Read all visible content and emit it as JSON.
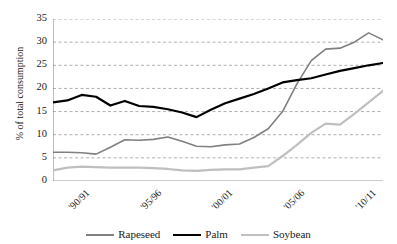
{
  "chart_data": {
    "type": "line",
    "title": "",
    "xlabel": "",
    "ylabel": "% of total consumption",
    "ylim": [
      0,
      35
    ],
    "ytick_labels": [
      "0",
      "5",
      "10",
      "15",
      "20",
      "25",
      "30",
      "35"
    ],
    "ytick_values": [
      0,
      5,
      10,
      15,
      20,
      25,
      30,
      35
    ],
    "grid": true,
    "grid_style": "dashed-horizontal",
    "legend_position": "bottom-center",
    "x": [
      "'90/91",
      "'91/92",
      "'92/93",
      "'93/94",
      "'94/95",
      "'95/96",
      "'96/97",
      "'97/98",
      "'98/99",
      "'99/00",
      "'00/01",
      "'01/02",
      "'02/03",
      "'03/04",
      "'04/05",
      "'05/06",
      "'06/07",
      "'07/08",
      "'08/09",
      "'09/10",
      "'10/11",
      "'11/12",
      "'12/13",
      "'13/14"
    ],
    "xtick_labels": [
      "'90/91",
      "'95/96",
      "'00/01",
      "'05/06",
      "'10/11"
    ],
    "xtick_indices": [
      0,
      5,
      10,
      15,
      20
    ],
    "series": [
      {
        "name": "Rapeseed",
        "color": "#808080",
        "values": [
          6.2,
          6.2,
          6.1,
          5.8,
          7.3,
          8.9,
          8.8,
          9.0,
          9.5,
          8.6,
          7.5,
          7.4,
          7.8,
          8.0,
          9.4,
          11.3,
          15.0,
          21.0,
          26.0,
          28.5,
          28.7,
          30.0,
          32.0,
          30.5
        ]
      },
      {
        "name": "Palm",
        "color": "#000000",
        "values": [
          17.0,
          17.4,
          18.6,
          18.2,
          16.3,
          17.3,
          16.2,
          16.0,
          15.5,
          14.8,
          13.8,
          15.4,
          16.8,
          17.8,
          18.8,
          20.0,
          21.3,
          21.8,
          22.2,
          23.0,
          23.8,
          24.4,
          25.0,
          25.5
        ]
      },
      {
        "name": "Soybean",
        "color": "#bfbfbf",
        "values": [
          2.3,
          2.9,
          3.1,
          3.0,
          2.9,
          2.9,
          2.9,
          2.8,
          2.6,
          2.3,
          2.2,
          2.4,
          2.5,
          2.5,
          2.9,
          3.2,
          5.4,
          7.8,
          10.4,
          12.4,
          12.2,
          14.5,
          17.0,
          19.5
        ]
      }
    ]
  },
  "legend": {
    "items": [
      {
        "label": "Rapeseed",
        "color": "#808080",
        "width": "2px"
      },
      {
        "label": "Palm",
        "color": "#000000",
        "width": "2.5px"
      },
      {
        "label": "Soybean",
        "color": "#bfbfbf",
        "width": "2.5px"
      }
    ]
  },
  "axis": {
    "y_title": "% of total consumption",
    "axis_color": "#7f7f7f",
    "grid_color": "#9a9a9a"
  }
}
